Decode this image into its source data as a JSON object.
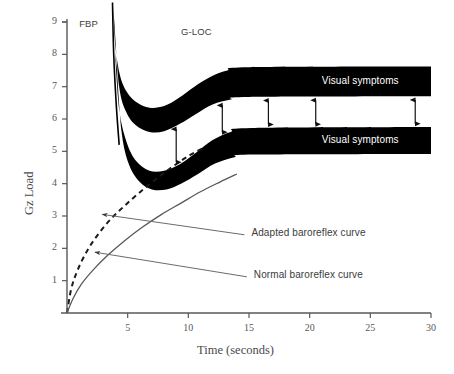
{
  "chart_data": {
    "type": "area",
    "title": "",
    "xlabel": "Time (seconds)",
    "ylabel": "Gz Load",
    "xlim": [
      0,
      30
    ],
    "ylim": [
      0,
      9
    ],
    "grid": false,
    "legend_position": "inline-callouts",
    "xticks": [
      {
        "value": 5,
        "label": "5"
      },
      {
        "value": 10,
        "label": "10"
      },
      {
        "value": 15,
        "label": "15"
      },
      {
        "value": 20,
        "label": "20"
      },
      {
        "value": 25,
        "label": "25"
      },
      {
        "value": 30,
        "label": "30"
      }
    ],
    "yticks": [
      {
        "value": 1,
        "label": "1"
      },
      {
        "value": 2,
        "label": "2"
      },
      {
        "value": 3,
        "label": "3"
      },
      {
        "value": 4,
        "label": "4"
      },
      {
        "value": 5,
        "label": "5"
      },
      {
        "value": 6,
        "label": "6"
      },
      {
        "value": 7,
        "label": "7"
      },
      {
        "value": 8,
        "label": "8"
      },
      {
        "value": 9,
        "label": "9"
      }
    ],
    "annotations": [
      {
        "name": "fbp",
        "text": "FBP",
        "x": 1.0,
        "y": 8.95
      },
      {
        "name": "gloc",
        "text": "G-LOC",
        "x": 9.4,
        "y": 8.7
      }
    ],
    "series": [
      {
        "name": "Adapted baroreflex curve",
        "type": "line",
        "style": "dashed",
        "color": "#1a1a1a",
        "points": [
          {
            "x": 0.0,
            "y": 0.0
          },
          {
            "x": 0.35,
            "y": 0.75
          },
          {
            "x": 0.9,
            "y": 1.35
          },
          {
            "x": 1.7,
            "y": 1.95
          },
          {
            "x": 2.6,
            "y": 2.45
          },
          {
            "x": 3.6,
            "y": 2.9
          },
          {
            "x": 4.7,
            "y": 3.3
          },
          {
            "x": 5.9,
            "y": 3.7
          },
          {
            "x": 7.2,
            "y": 4.1
          },
          {
            "x": 8.6,
            "y": 4.5
          },
          {
            "x": 10.0,
            "y": 4.85
          },
          {
            "x": 11.2,
            "y": 5.1
          }
        ]
      },
      {
        "name": "Normal baroreflex curve",
        "type": "line",
        "style": "solid",
        "color": "#58585a",
        "points": [
          {
            "x": 0.0,
            "y": 0.0
          },
          {
            "x": 0.5,
            "y": 0.45
          },
          {
            "x": 1.2,
            "y": 0.9
          },
          {
            "x": 2.2,
            "y": 1.35
          },
          {
            "x": 3.4,
            "y": 1.8
          },
          {
            "x": 4.8,
            "y": 2.25
          },
          {
            "x": 6.2,
            "y": 2.65
          },
          {
            "x": 7.8,
            "y": 3.05
          },
          {
            "x": 9.4,
            "y": 3.4
          },
          {
            "x": 11.0,
            "y": 3.75
          },
          {
            "x": 12.6,
            "y": 4.05
          },
          {
            "x": 14.0,
            "y": 4.3
          }
        ]
      },
      {
        "name": "Upper tolerance band (visual symptoms)",
        "type": "band",
        "color": "#000000",
        "label": "Visual symptoms",
        "upper_edge": [
          {
            "x": 3.8,
            "y": 9.5
          },
          {
            "x": 4.0,
            "y": 8.2
          },
          {
            "x": 4.4,
            "y": 7.3
          },
          {
            "x": 5.0,
            "y": 6.8
          },
          {
            "x": 5.8,
            "y": 6.5
          },
          {
            "x": 6.8,
            "y": 6.35
          },
          {
            "x": 8.0,
            "y": 6.4
          },
          {
            "x": 9.2,
            "y": 6.65
          },
          {
            "x": 10.5,
            "y": 7.0
          },
          {
            "x": 11.8,
            "y": 7.3
          },
          {
            "x": 13.2,
            "y": 7.5
          },
          {
            "x": 15.0,
            "y": 7.6
          },
          {
            "x": 30.0,
            "y": 7.62
          }
        ],
        "lower_edge": [
          {
            "x": 3.9,
            "y": 9.0
          },
          {
            "x": 4.3,
            "y": 7.0
          },
          {
            "x": 4.9,
            "y": 6.2
          },
          {
            "x": 5.7,
            "y": 5.8
          },
          {
            "x": 6.8,
            "y": 5.6
          },
          {
            "x": 8.0,
            "y": 5.62
          },
          {
            "x": 9.3,
            "y": 5.85
          },
          {
            "x": 10.6,
            "y": 6.15
          },
          {
            "x": 12.0,
            "y": 6.45
          },
          {
            "x": 13.5,
            "y": 6.6
          },
          {
            "x": 15.0,
            "y": 6.68
          },
          {
            "x": 30.0,
            "y": 6.7
          }
        ]
      },
      {
        "name": "Lower tolerance band (visual symptoms)",
        "type": "band",
        "color": "#000000",
        "label": "Visual symptoms",
        "upper_edge": [
          {
            "x": 3.95,
            "y": 8.1
          },
          {
            "x": 4.3,
            "y": 6.3
          },
          {
            "x": 4.9,
            "y": 5.3
          },
          {
            "x": 5.7,
            "y": 4.7
          },
          {
            "x": 6.8,
            "y": 4.4
          },
          {
            "x": 8.0,
            "y": 4.4
          },
          {
            "x": 9.3,
            "y": 4.6
          },
          {
            "x": 10.6,
            "y": 4.95
          },
          {
            "x": 12.0,
            "y": 5.35
          },
          {
            "x": 13.5,
            "y": 5.6
          },
          {
            "x": 15.2,
            "y": 5.72
          },
          {
            "x": 30.0,
            "y": 5.75
          }
        ],
        "lower_edge": [
          {
            "x": 4.1,
            "y": 7.6
          },
          {
            "x": 4.5,
            "y": 5.6
          },
          {
            "x": 5.1,
            "y": 4.6
          },
          {
            "x": 6.0,
            "y": 4.05
          },
          {
            "x": 7.0,
            "y": 3.82
          },
          {
            "x": 8.2,
            "y": 3.82
          },
          {
            "x": 9.4,
            "y": 4.0
          },
          {
            "x": 10.8,
            "y": 4.3
          },
          {
            "x": 12.2,
            "y": 4.62
          },
          {
            "x": 13.8,
            "y": 4.82
          },
          {
            "x": 15.4,
            "y": 4.9
          },
          {
            "x": 30.0,
            "y": 4.92
          }
        ]
      },
      {
        "name": "G-LOC onset spike",
        "type": "line",
        "style": "solid",
        "color": "#000000",
        "points": [
          {
            "x": 3.75,
            "y": 9.6
          },
          {
            "x": 3.85,
            "y": 8.0
          },
          {
            "x": 4.05,
            "y": 6.5
          },
          {
            "x": 4.3,
            "y": 5.2
          }
        ]
      }
    ],
    "gap_arrows": {
      "name": "visual-symptom-gap-arrows",
      "count": 5,
      "x_values": [
        9.0,
        12.8,
        16.6,
        20.5,
        28.7
      ],
      "style": "double-headed-vertical"
    },
    "callouts": [
      {
        "name": "adapted-baroreflex-callout",
        "text": "Adapted baroreflex curve",
        "text_x": 15.2,
        "text_y": 2.45,
        "target_x": 2.9,
        "target_y": 3.05
      },
      {
        "name": "normal-baroreflex-callout",
        "text": "Normal baroreflex curve",
        "text_x": 15.4,
        "text_y": 1.15,
        "target_x": 2.3,
        "target_y": 1.88
      }
    ]
  }
}
